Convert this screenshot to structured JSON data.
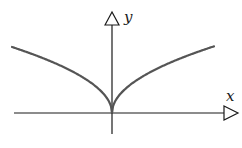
{
  "diagram": {
    "x_axis_label": "x",
    "y_axis_label": "y",
    "colors": {
      "axis": "#1a1a1a",
      "curve": "#555555",
      "background": "#ffffff"
    }
  },
  "chart_data": {
    "type": "line",
    "title": "",
    "xlabel": "x",
    "ylabel": "y",
    "function": "y = sqrt(|x|)",
    "series": [
      {
        "name": "curve",
        "x": [
          -1,
          -0.75,
          -0.5,
          -0.25,
          -0.1,
          0,
          0.1,
          0.25,
          0.5,
          0.75,
          1
        ],
        "values": [
          1,
          0.866,
          0.707,
          0.5,
          0.316,
          0,
          0.316,
          0.5,
          0.707,
          0.866,
          1
        ]
      }
    ],
    "grid": false,
    "legend": "none"
  }
}
